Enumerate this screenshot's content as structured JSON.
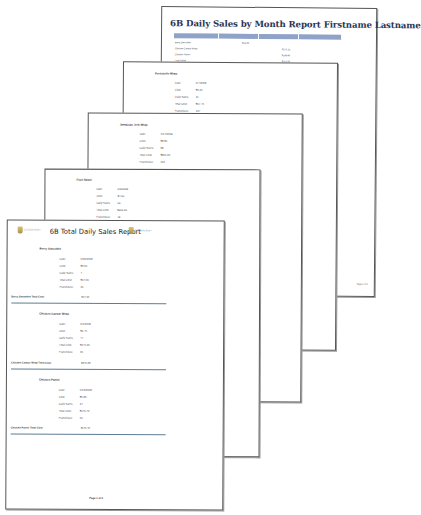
{
  "month_report": {
    "title": "6B Daily Sales by Month Report Firstname Lastname",
    "header_color": "#8fa3c8",
    "rows": [
      {
        "name": "Berry Smoothie",
        "col": 1,
        "value": "$14.00"
      },
      {
        "name": "Chicken Caesar Wrap",
        "col": 2,
        "value": "$270.25"
      },
      {
        "name": "Chicken Panini",
        "col": 2,
        "value": "$149.40"
      },
      {
        "name": "Fruit Salad",
        "col": 2,
        "value": "$252.00"
      },
      {
        "name": "Grilled Veggie Panini",
        "col": 1,
        "value": "$280.00",
        "value2": "$168.00"
      }
    ],
    "footer": "Page 1 of 1"
  },
  "labels": {
    "date": "Date:",
    "cost": "Cost:",
    "daily_sales": "Daily Sales:",
    "total_cost": "Total Cost:",
    "franchise": "Franchise#:"
  },
  "pages": [
    {
      "item": "Portobello Wrap",
      "date": "6/7/2009",
      "cost": "$5.25",
      "daily_sales": "11",
      "total_cost": "$57.75",
      "franchise": "137"
    },
    {
      "item": "Jamaican Jerk Wrap",
      "date": "5/17/2009",
      "cost": "$9.90",
      "daily_sales": "98",
      "total_cost": "$961.00",
      "franchise": "113"
    },
    {
      "item": "Fruit Salad",
      "date": "6/2/2009",
      "cost": "$4.50",
      "daily_sales": "56",
      "total_cost": "$252.00",
      "franchise": "49"
    }
  ],
  "front_page": {
    "title": "6B Total Daily Sales Report",
    "logo_text": "Grill Daily Bistro",
    "groups": [
      {
        "item": "Berry Smoothie",
        "date": "5/30/2009",
        "cost": "$3.50",
        "daily_sales": "4",
        "total_cost": "$14.00",
        "franchise": "31",
        "total_label": "Berry Smoothie Total Cost:",
        "total_value": "$14.00"
      },
      {
        "item": "Chicken Caesar Wrap",
        "date": "6/1/2009",
        "cost": "$5.75",
        "daily_sales": "47",
        "total_cost": "$270.25",
        "franchise": "36",
        "total_label": "Chicken Caesar Wrap Total Cost:",
        "total_value": "$270.25"
      },
      {
        "item": "Chicken Panini",
        "date": "6/13/2009",
        "cost": "$5.85",
        "daily_sales": "24",
        "total_cost": "$140.40",
        "franchise": "56",
        "total_label": "Chicken Panini Total Cost:",
        "total_value": "$140.40"
      }
    ],
    "footer": "Page 1 of 3",
    "separator_color": "#5e7d94"
  }
}
